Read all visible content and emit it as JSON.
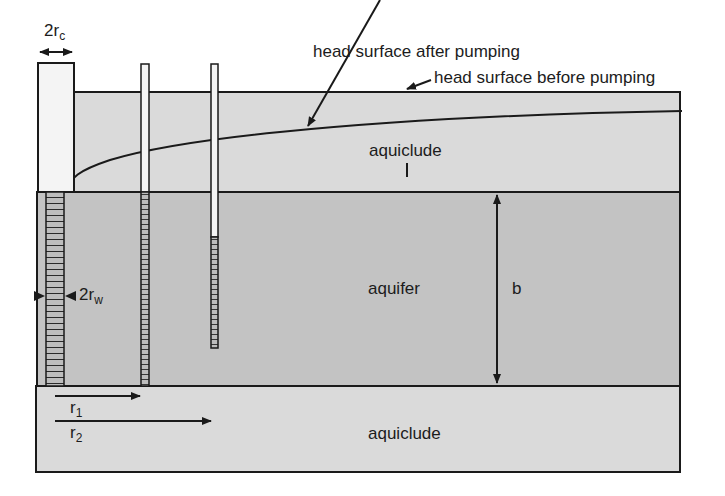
{
  "diagram": {
    "type": "confined-aquifer-pumping-well-cross-section",
    "labels": {
      "casing_diameter": "2r",
      "casing_diameter_sub": "c",
      "head_after": "head surface after pumping",
      "head_before": "head surface before pumping",
      "upper_layer": "aquiclude",
      "upper_layer_mark": "I",
      "aquifer": "aquifer",
      "thickness": "b",
      "well_diameter": "2r",
      "well_diameter_sub": "w",
      "r1": "r",
      "r1_sub": "1",
      "r2": "r",
      "r2_sub": "2",
      "lower_layer": "aquiclude"
    },
    "colors": {
      "aquiclude_fill": "#d9d9d9",
      "aquifer_fill": "#c4c4c4",
      "line": "#1a1a1a",
      "casing_fill": "#f4f4f4",
      "screen_fill": "#bdbdbd"
    },
    "layers": [
      {
        "name": "upper aquiclude",
        "top": 92,
        "bottom": 192
      },
      {
        "name": "aquifer",
        "top": 192,
        "bottom": 386
      },
      {
        "name": "lower aquiclude",
        "top": 386,
        "bottom": 472
      }
    ],
    "wells": [
      {
        "name": "pumping well",
        "casing_top": 63,
        "screen": [
          192,
          386
        ]
      },
      {
        "name": "piezometer r1",
        "top": 64,
        "screen": [
          192,
          386
        ]
      },
      {
        "name": "piezometer r2",
        "top": 64,
        "screen": [
          237,
          348
        ]
      }
    ]
  }
}
